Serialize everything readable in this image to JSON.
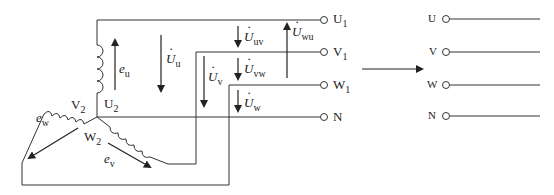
{
  "diagram": {
    "left_terminals": [
      {
        "label": "U",
        "sub": "1"
      },
      {
        "label": "V",
        "sub": "1"
      },
      {
        "label": "W",
        "sub": "1"
      },
      {
        "label": "N",
        "sub": ""
      }
    ],
    "winding_ends": [
      {
        "label": "U",
        "sub": "2"
      },
      {
        "label": "V",
        "sub": "2"
      },
      {
        "label": "W",
        "sub": "2"
      }
    ],
    "emfs": [
      {
        "symbol": "e",
        "sub": "u"
      },
      {
        "symbol": "e",
        "sub": "v"
      },
      {
        "symbol": "e",
        "sub": "w"
      }
    ],
    "phase_voltages": [
      {
        "symbol": "U",
        "sub": "u"
      },
      {
        "symbol": "U",
        "sub": "v"
      },
      {
        "symbol": "U",
        "sub": "w"
      }
    ],
    "line_voltages": [
      {
        "symbol": "U",
        "sub": "uv"
      },
      {
        "symbol": "U",
        "sub": "vw"
      },
      {
        "symbol": "U",
        "sub": "wu"
      }
    ],
    "right_terminals": [
      {
        "label": "U"
      },
      {
        "label": "V"
      },
      {
        "label": "W"
      },
      {
        "label": "N"
      }
    ],
    "line_color": "#333333"
  }
}
